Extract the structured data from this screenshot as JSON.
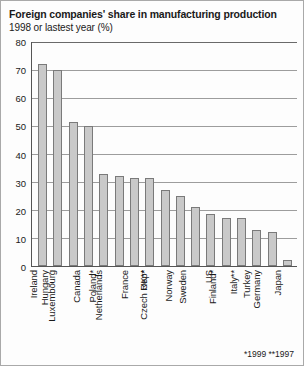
{
  "chart_data": {
    "type": "bar",
    "title": "Foreign companies' share in manufacturing production",
    "subtitle": "1998 or lastest year (%)",
    "xlabel": "",
    "ylabel": "",
    "ylim": [
      0,
      80
    ],
    "yticks": [
      0,
      10,
      20,
      30,
      40,
      50,
      60,
      70,
      80
    ],
    "grid": true,
    "legend": null,
    "footnote": "*1999 **1997",
    "bar_color": "#c9c9c9",
    "bar_edge_color": "#7a7a7a",
    "categories": [
      "Ireland",
      "Hungary",
      "Luxembourg",
      "Canada",
      "Poland*",
      "Netherlands",
      "France",
      "UK**",
      "Czech Rep*",
      "Norway",
      "Sweden",
      "US",
      "Finland*",
      "Italy**",
      "Turkey",
      "Germany",
      "Japan"
    ],
    "values": [
      72,
      70,
      51.5,
      50,
      33,
      32,
      31.5,
      31.5,
      27,
      25,
      21,
      18.5,
      17,
      17,
      13,
      12,
      2
    ]
  }
}
